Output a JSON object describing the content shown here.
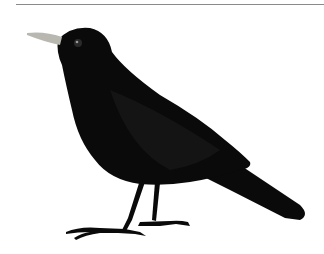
{
  "image": {
    "subject": "blackbird-illustration",
    "colors": {
      "body": "#0a0a0a",
      "beak": "#b8b8b0",
      "background": "#ffffff",
      "rule": "#8a8a8a"
    }
  }
}
